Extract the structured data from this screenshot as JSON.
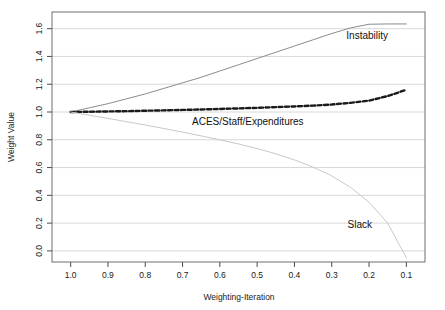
{
  "chart_data": {
    "type": "line",
    "title": "",
    "xlabel": "Weighting-Iteration",
    "ylabel": "Weight Value",
    "xlim": [
      1.05,
      0.05
    ],
    "ylim": [
      -0.08,
      1.72
    ],
    "x_reversed": true,
    "grid": true,
    "grid_axis": "y",
    "legend_position": "inline-annotations",
    "x_ticks": [
      "1.0",
      "0.9",
      "0.8",
      "0.7",
      "0.6",
      "0.5",
      "0.4",
      "0.3",
      "0.2",
      "0.1"
    ],
    "x_tick_values": [
      1.0,
      0.9,
      0.8,
      0.7,
      0.6,
      0.5,
      0.4,
      0.3,
      0.2,
      0.1
    ],
    "y_ticks": [
      "0.0",
      "0.2",
      "0.4",
      "0.6",
      "0.8",
      "1.0",
      "1.2",
      "1.4",
      "1.6"
    ],
    "y_tick_values": [
      0.0,
      0.2,
      0.4,
      0.6,
      0.8,
      1.0,
      1.2,
      1.4,
      1.6
    ],
    "x": [
      1.0,
      0.95,
      0.9,
      0.85,
      0.8,
      0.75,
      0.7,
      0.65,
      0.6,
      0.55,
      0.5,
      0.45,
      0.4,
      0.35,
      0.3,
      0.25,
      0.2,
      0.15,
      0.1
    ],
    "series": [
      {
        "name": "Instability",
        "color": "#8c8c8c",
        "style": "solid",
        "width": 1,
        "values": [
          1.0,
          1.03,
          1.06,
          1.095,
          1.13,
          1.17,
          1.21,
          1.25,
          1.295,
          1.34,
          1.385,
          1.43,
          1.475,
          1.52,
          1.565,
          1.605,
          1.632,
          1.634,
          1.634
        ],
        "label": "Instability",
        "label_x": 0.205,
        "label_y": 1.525
      },
      {
        "name": "ACES/Staff/Expenditures",
        "color": "#1a1a1a",
        "style": "dashed",
        "width": 2.4,
        "values": [
          1.0,
          1.002,
          1.004,
          1.006,
          1.009,
          1.012,
          1.015,
          1.018,
          1.022,
          1.026,
          1.03,
          1.035,
          1.04,
          1.046,
          1.054,
          1.066,
          1.082,
          1.115,
          1.16
        ],
        "label": "ACES/Staff/Expenditures",
        "label_x": 0.525,
        "label_y": 0.905
      },
      {
        "name": "Slack",
        "color": "#c9c9c9",
        "style": "solid",
        "width": 1,
        "values": [
          1.0,
          0.977,
          0.954,
          0.93,
          0.906,
          0.881,
          0.855,
          0.828,
          0.8,
          0.77,
          0.737,
          0.699,
          0.655,
          0.603,
          0.54,
          0.458,
          0.35,
          0.2,
          -0.05
        ],
        "label": "Slack",
        "label_x": 0.225,
        "label_y": 0.165
      }
    ]
  }
}
